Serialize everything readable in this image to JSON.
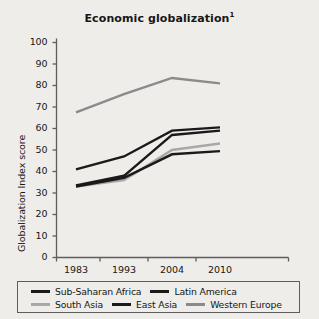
{
  "chart_data": {
    "type": "line",
    "title": "Economic globalization",
    "title_superscript": "1",
    "xlabel": "",
    "ylabel": "Globalization Index score",
    "x": [
      "1983",
      "1993",
      "2004",
      "2010"
    ],
    "categories": [
      "1983",
      "1993",
      "2004",
      "2010"
    ],
    "xticks": [
      "1983",
      "1993",
      "2004",
      "2010"
    ],
    "yticks": [
      "0",
      "10",
      "20",
      "30",
      "40",
      "50",
      "60",
      "70",
      "80",
      "90",
      "100"
    ],
    "ylim": [
      0,
      100
    ],
    "ytick_step": 10,
    "grid": false,
    "legend_position": "below-axes",
    "series": [
      {
        "name": "Sub-Saharan Africa",
        "color": "#1a1a1a",
        "values": [
          33.5,
          38.0,
          57.0,
          59.0
        ]
      },
      {
        "name": "Latin America",
        "color": "#1a1a1a",
        "values": [
          41.0,
          47.0,
          59.0,
          60.5
        ]
      },
      {
        "name": "South Asia",
        "color": "#a8a8a8",
        "values": [
          33.0,
          36.0,
          50.0,
          53.0
        ]
      },
      {
        "name": "East Asia",
        "color": "#1a1a1a",
        "values": [
          33.0,
          37.0,
          48.0,
          49.5
        ]
      },
      {
        "name": "Western Europe",
        "color": "#8a8a8a",
        "values": [
          67.5,
          76.0,
          83.5,
          81.0
        ]
      }
    ]
  },
  "legend": {
    "row1": [
      {
        "label": "Sub-Saharan Africa",
        "color": "#1a1a1a"
      },
      {
        "label": "Latin America",
        "color": "#1a1a1a"
      }
    ],
    "row2": [
      {
        "label": "South Asia",
        "color": "#a8a8a8"
      },
      {
        "label": "East Asia",
        "color": "#1a1a1a"
      },
      {
        "label": "Western Europe",
        "color": "#8a8a8a"
      }
    ]
  },
  "colors": {
    "background": "#efedea",
    "axis": "#5d5d5d",
    "text": "#161616",
    "dark_line": "#1a1a1a",
    "mid_gray_line": "#8a8a8a",
    "light_gray_line": "#a8a8a8"
  }
}
